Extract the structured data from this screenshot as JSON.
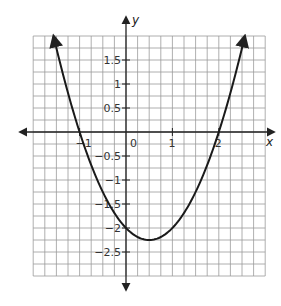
{
  "chart_data": {
    "type": "line",
    "title": "",
    "xlabel": "x",
    "ylabel": "y",
    "xlim": [
      -2,
      3
    ],
    "ylim": [
      -3,
      2
    ],
    "grid": true,
    "grid_step": 0.25,
    "equation": "y = x^2 - x - 2",
    "x_ticks": [
      {
        "value": -1,
        "label": "-1"
      },
      {
        "value": 0,
        "label": "0"
      },
      {
        "value": 1,
        "label": "1"
      },
      {
        "value": 2,
        "label": "2"
      }
    ],
    "y_ticks": [
      {
        "value": 1.5,
        "label": "1.5"
      },
      {
        "value": 1,
        "label": "1"
      },
      {
        "value": 0.5,
        "label": "0.5"
      },
      {
        "value": -0.5,
        "label": "-0.5"
      },
      {
        "value": -1,
        "label": "-1"
      },
      {
        "value": -1.5,
        "label": "-1.5"
      },
      {
        "value": -2,
        "label": "-2"
      },
      {
        "value": -2.5,
        "label": "-2.5"
      }
    ],
    "series": [
      {
        "name": "parabola",
        "x": [
          -1.56,
          -1.5,
          -1,
          -0.5,
          0,
          0.5,
          1,
          1.5,
          2,
          2.5,
          2.56
        ],
        "y": [
          2.0,
          1.75,
          0,
          -1.25,
          -2,
          -2.25,
          -2,
          -1.25,
          0,
          1.75,
          2.0
        ]
      }
    ],
    "key_points": {
      "roots": [
        -1,
        2
      ],
      "y_intercept": -2,
      "vertex": [
        0.5,
        -2.25
      ]
    }
  },
  "labels": {
    "x_axis": "x",
    "y_axis": "y",
    "origin": "0"
  },
  "colors": {
    "grid": "#9a9a9a",
    "axis": "#222222",
    "curve": "#1a1a1a"
  }
}
